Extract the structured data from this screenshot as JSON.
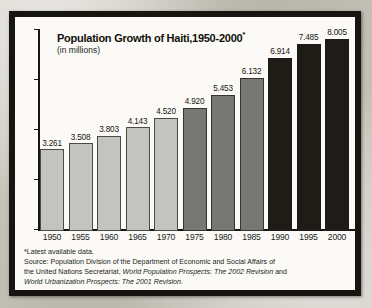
{
  "figure": {
    "title": "Population Growth of Haiti,1950-2000",
    "title_marker": "*",
    "subtitle": "(in millions)"
  },
  "footnote": {
    "line1": "*Latest available data.",
    "line2_a": "Source: Population Division of the Department of Economic and Social Affairs of",
    "line3_a": "the United Nations Secretariat, ",
    "line3_b": "World Population Prospects: The 2002 Revision",
    "line3_c": " and",
    "line4_a": "World Urbanization Prospects: The 2001 Revision",
    "line4_b": "."
  },
  "axes": {
    "y_ticks": [
      "0",
      "2",
      "4",
      "6",
      "8"
    ],
    "x_ticks": [
      "1950",
      "1955",
      "1960",
      "1965",
      "1970",
      "1975",
      "1980",
      "1985",
      "1990",
      "1995",
      "2000"
    ]
  },
  "colors": {
    "light_bar": "#c3c3c0",
    "medium_bar": "#777773",
    "dark_bar": "#1d1c16",
    "frame": "#16150f",
    "plot_background": "#fbfaf7",
    "page_background": "#c9c6bd"
  },
  "chart_data": {
    "type": "bar",
    "title": "Population Growth of Haiti,1950-2000*",
    "subtitle": "(in millions)",
    "xlabel": "",
    "ylabel": "(in millions)",
    "ylim": [
      0,
      8
    ],
    "y_ticks": [
      0,
      2,
      4,
      6,
      8
    ],
    "grid": false,
    "legend": false,
    "categories": [
      "1950",
      "1955",
      "1960",
      "1965",
      "1970",
      "1975",
      "1980",
      "1985",
      "1990",
      "1995",
      "2000"
    ],
    "values": [
      3.261,
      3.508,
      3.803,
      4.143,
      4.52,
      4.92,
      5.453,
      6.132,
      6.914,
      7.485,
      8.005
    ],
    "value_labels": [
      "3.261",
      "3.508",
      "3.803",
      "4.143",
      "4.520",
      "4.920",
      "5.453",
      "6.132",
      "6.914",
      "7.485",
      "8.005"
    ],
    "bar_shades": [
      "light",
      "light",
      "light",
      "light",
      "light",
      "medium",
      "medium",
      "medium",
      "dark",
      "dark",
      "dark"
    ],
    "units": "millions of people",
    "source": "Population Division of the Department of Economic and Social Affairs of the United Nations Secretariat, World Population Prospects: The 2002 Revision and World Urbanization Prospects: The 2001 Revision."
  }
}
